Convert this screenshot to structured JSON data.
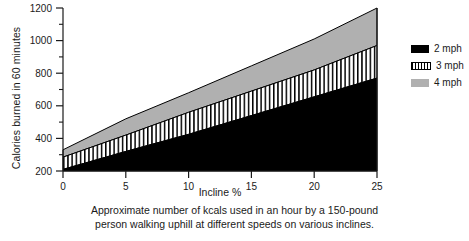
{
  "chart_data": {
    "type": "area",
    "title": "",
    "xlabel": "Incline %",
    "ylabel": "Calories burned in 60 minutes",
    "xlim": [
      0,
      25
    ],
    "ylim": [
      200,
      1200
    ],
    "x_ticks": [
      0,
      5,
      10,
      15,
      20,
      25
    ],
    "y_ticks": [
      200,
      400,
      600,
      800,
      1000,
      1200
    ],
    "y_minor_ticks": [
      300,
      500,
      700,
      900,
      1100
    ],
    "grid": false,
    "legend_position": "right",
    "stacked": true,
    "x": [
      0,
      5,
      10,
      15,
      20,
      25
    ],
    "series": [
      {
        "name": "2 mph",
        "fill": "solid-black",
        "color": "#000000",
        "values": [
          210,
          320,
          425,
          540,
          655,
          770
        ],
        "cumulative_top": [
          210,
          320,
          425,
          540,
          655,
          770
        ]
      },
      {
        "name": "3 mph",
        "fill": "vertical-hatch",
        "color": "#ffffff",
        "values": [
          75,
          100,
          135,
          150,
          165,
          200
        ],
        "cumulative_top": [
          285,
          420,
          560,
          690,
          820,
          970
        ]
      },
      {
        "name": "4 mph",
        "fill": "solid-gray",
        "color": "#b0b0b0",
        "values": [
          45,
          100,
          120,
          155,
          190,
          230
        ],
        "cumulative_top": [
          330,
          520,
          680,
          845,
          1010,
          1200
        ]
      }
    ]
  },
  "axes": {
    "y_title": "Calories burned in 60 minutes",
    "x_title": "Incline %",
    "y_tick_labels": [
      "200",
      "400",
      "600",
      "800",
      "1000",
      "1200"
    ],
    "x_tick_labels": [
      "0",
      "5",
      "10",
      "15",
      "20",
      "25"
    ]
  },
  "legend": {
    "items": [
      {
        "label": "2 mph",
        "swatch": "solid-black-swatch"
      },
      {
        "label": "3 mph",
        "swatch": "hatched-swatch"
      },
      {
        "label": "4 mph",
        "swatch": "gray-swatch"
      }
    ]
  },
  "caption": {
    "line1": "Approximate number of kcals used in an hour by a 150-pound",
    "line2": "person walking uphill at different speeds on various inclines."
  },
  "colors": {
    "band_2mph": "#000000",
    "band_3mph": "#ffffff",
    "band_4mph": "#b0b0b0",
    "axis": "#1a1a1a",
    "background": "#ffffff"
  }
}
